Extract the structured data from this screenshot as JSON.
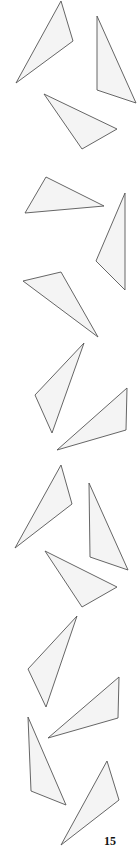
{
  "page": {
    "page_number": "15",
    "colors": {
      "stroke": "#555555",
      "fill": "#f4f4f4",
      "background": "#ffffff",
      "text": "#111111"
    }
  },
  "triangles": [
    {
      "id": 1,
      "points": "61,1 73,41 16,83"
    },
    {
      "id": 2,
      "points": "97,16 136,103 97,90"
    },
    {
      "id": 3,
      "points": "44,94 117,129 82,149"
    },
    {
      "id": 4,
      "points": "46,177 104,206 25,213"
    },
    {
      "id": 5,
      "points": "125,193 125,290 96,261"
    },
    {
      "id": 6,
      "points": "23,281 61,272 98,337"
    },
    {
      "id": 7,
      "points": "84,343 35,395 52,433"
    },
    {
      "id": 8,
      "points": "127,388 126,430 57,450"
    },
    {
      "id": 9,
      "points": "61,465 72,504 15,548"
    },
    {
      "id": 10,
      "points": "89,483 128,570 90,557"
    },
    {
      "id": 11,
      "points": "45,551 117,587 82,607"
    },
    {
      "id": 12,
      "points": "77,616 28,669 46,707"
    },
    {
      "id": 13,
      "points": "119,677 118,718 48,738"
    },
    {
      "id": 14,
      "points": "28,717 66,805 31,791"
    },
    {
      "id": 15,
      "points": "107,761 119,800 61,845"
    }
  ]
}
